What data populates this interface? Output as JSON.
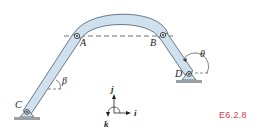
{
  "figure": {
    "id_label": "E6.2.8",
    "id_color": "#d9424f",
    "link_fill": "#cfe1ee",
    "link_stroke": "#4a5a68",
    "ground_color": "#9aa0a6"
  },
  "points": {
    "A": "A",
    "B": "B",
    "C": "C",
    "D": "D"
  },
  "angles": {
    "beta": "β",
    "theta": "θ"
  },
  "axes": {
    "j": "j",
    "i": "i",
    "k": "k"
  }
}
